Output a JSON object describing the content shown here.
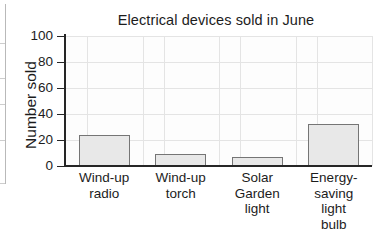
{
  "chart_data": {
    "type": "bar",
    "title": "Electrical devices sold in June",
    "xlabel": "",
    "ylabel": "Number sold",
    "categories": [
      "Wind-up radio",
      "Wind-up torch",
      "Solar Garden light",
      "Energy-saving light bulb"
    ],
    "category_lines": [
      [
        "Wind-up",
        "radio"
      ],
      [
        "Wind-up",
        "torch"
      ],
      [
        "Solar",
        "Garden",
        "light"
      ],
      [
        "Energy-",
        "saving",
        "light",
        "bulb"
      ]
    ],
    "values": [
      24,
      9,
      7,
      32
    ],
    "ylim": [
      0,
      100
    ],
    "ytick_labels": [
      "0",
      "20",
      "40",
      "60",
      "80",
      "100"
    ],
    "ytick_values": [
      0,
      20,
      40,
      60,
      80,
      100
    ],
    "grid": true,
    "legend": null,
    "colors": {
      "bar_fill": "#e8e8e8",
      "bar_edge": "#757575",
      "axis": "#262626",
      "grid": "#e4e4e4",
      "text": "#1c1c1c",
      "background": "#ffffff"
    }
  }
}
